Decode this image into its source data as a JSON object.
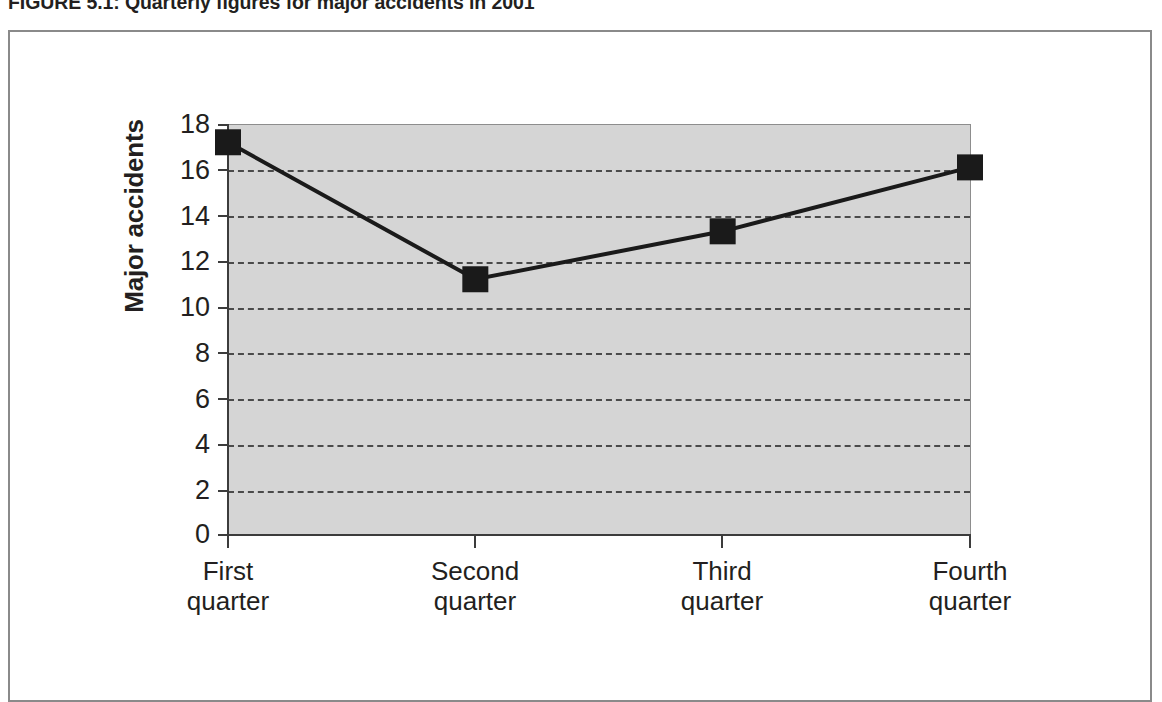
{
  "figure": {
    "caption": "FIGURE 5.1: Quarterly figures for major accidents in 2001"
  },
  "chart_data": {
    "type": "line",
    "title": "",
    "xlabel": "",
    "ylabel": "Major accidents",
    "categories": [
      "First quarter",
      "Second quarter",
      "Third quarter",
      "Fourth quarter"
    ],
    "category_lines": [
      [
        "First",
        "quarter"
      ],
      [
        "Second",
        "quarter"
      ],
      [
        "Third",
        "quarter"
      ],
      [
        "Fourth",
        "quarter"
      ]
    ],
    "values": [
      17.2,
      11.2,
      13.3,
      16.1
    ],
    "ylim": [
      0,
      18
    ],
    "ytick_labels": [
      "18",
      "16",
      "14",
      "12",
      "10",
      "8",
      "6",
      "4",
      "2",
      "0"
    ],
    "ytick_values": [
      18,
      16,
      14,
      12,
      10,
      8,
      6,
      4,
      2,
      0
    ],
    "grid": true,
    "legend": "none",
    "colors": {
      "plot_background": "#d5d5d5",
      "series_line": "#1a1a1a",
      "marker": "#1a1a1a",
      "gridline": "#4a4a4a",
      "axis": "#3c3c3c",
      "frame": "#8a8a8a",
      "text": "#231f20"
    },
    "marker": "square"
  }
}
